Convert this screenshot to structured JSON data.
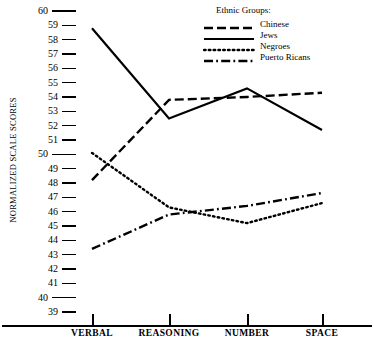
{
  "chart_data": {
    "type": "line",
    "title": "",
    "xlabel": "",
    "ylabel": "NORMALIZED SCALE SCORES",
    "categories": [
      "VERBAL",
      "REASONING",
      "NUMBER",
      "SPACE"
    ],
    "ylim": [
      39,
      60
    ],
    "ytick_labels": [
      "60",
      "59",
      "58",
      "57",
      "56",
      "55",
      "54",
      "53",
      "52",
      "51",
      "50",
      "49",
      "48",
      "47",
      "46",
      "45",
      "44",
      "43",
      "42",
      "41",
      "40",
      "39"
    ],
    "ytick_values": [
      60,
      59,
      58,
      57,
      56,
      55,
      54,
      53,
      52,
      51,
      50,
      49,
      48,
      47,
      46,
      45,
      44,
      43,
      42,
      41,
      40,
      39
    ],
    "ytick_major": [
      60,
      50,
      40
    ],
    "grid": false,
    "legend_position": "top-right",
    "legend_title": "Ethnic Groups:",
    "series": [
      {
        "name": "Chinese",
        "style": "dashed",
        "values": [
          48.2,
          53.8,
          54.0,
          54.3
        ]
      },
      {
        "name": "Jews",
        "style": "solid",
        "values": [
          58.8,
          52.5,
          54.6,
          51.7
        ]
      },
      {
        "name": "Negroes",
        "style": "dotted",
        "values": [
          50.1,
          46.3,
          45.2,
          46.6
        ]
      },
      {
        "name": "Puerto Ricans",
        "style": "dash-dot",
        "values": [
          43.4,
          45.8,
          46.4,
          47.3
        ]
      }
    ],
    "colors": {
      "line": "#000000",
      "axis": "#000000",
      "background": "#ffffff"
    }
  }
}
